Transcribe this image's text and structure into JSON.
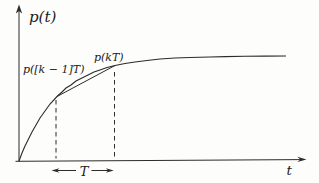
{
  "figure": {
    "colors": {
      "ink": "#2e2b28",
      "background": "#fdfdfc"
    },
    "y_axis_label": "p(t)",
    "x_axis_label": "t",
    "sample_labels": {
      "previous": "p([k − 1]T)",
      "current": "p(kT)"
    },
    "interval_label": "T",
    "curve": {
      "type": "line",
      "points": [
        [
          19,
          161
        ],
        [
          22,
          153
        ],
        [
          25,
          146
        ],
        [
          28,
          140
        ],
        [
          32,
          132
        ],
        [
          36,
          125
        ],
        [
          40,
          118
        ],
        [
          45,
          111
        ],
        [
          50,
          104
        ],
        [
          57,
          96.5
        ],
        [
          62,
          92
        ],
        [
          66,
          88
        ],
        [
          71,
          85
        ],
        [
          76,
          81
        ],
        [
          82,
          78
        ],
        [
          88,
          75
        ],
        [
          94,
          72
        ],
        [
          100,
          70
        ],
        [
          107,
          67.5
        ],
        [
          115,
          65.5
        ],
        [
          125,
          63.5
        ],
        [
          135,
          62
        ],
        [
          147,
          60.5
        ],
        [
          160,
          59
        ],
        [
          175,
          58
        ],
        [
          190,
          57.5
        ],
        [
          210,
          57
        ],
        [
          225,
          56.6
        ],
        [
          245,
          56.3
        ],
        [
          265,
          56.1
        ],
        [
          286,
          56
        ]
      ]
    },
    "chord": {
      "x1": 57,
      "y1": 96.5,
      "x2": 115,
      "y2": 65.5
    },
    "dashed_lines": [
      {
        "x": 56,
        "y1": 100,
        "y2": 158.5
      },
      {
        "x": 114.5,
        "y1": 72,
        "y2": 158.5
      }
    ]
  }
}
